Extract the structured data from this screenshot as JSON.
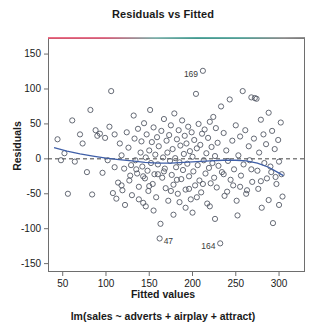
{
  "chart_data": {
    "type": "scatter",
    "title": "Residuals vs Fitted",
    "caption": "lm(sales ~ adverts + airplay + attract)",
    "xlabel": "Fitted values",
    "ylabel": "Residuals",
    "xlim": [
      33,
      330
    ],
    "ylim": [
      -162,
      173
    ],
    "xticks": [
      50,
      100,
      150,
      200,
      250,
      300
    ],
    "yticks": [
      150,
      100,
      50,
      0,
      -50,
      -100,
      -150
    ],
    "xtick_labels": [
      "50",
      "100",
      "150",
      "200",
      "250",
      "300"
    ],
    "ytick_labels": [
      "150",
      "100",
      "50",
      "0",
      "-50",
      "-100",
      "-150"
    ],
    "grid": false,
    "legend": null,
    "reference_line": {
      "y": 0,
      "style": "dashed",
      "color": "#444444"
    },
    "smoother": {
      "name": "loess",
      "color": "#3f5fa8",
      "points": [
        [
          40,
          16
        ],
        [
          55,
          11
        ],
        [
          70,
          7
        ],
        [
          85,
          4
        ],
        [
          100,
          1
        ],
        [
          115,
          -1
        ],
        [
          130,
          -3
        ],
        [
          145,
          -5
        ],
        [
          160,
          -6
        ],
        [
          175,
          -6
        ],
        [
          190,
          -5
        ],
        [
          205,
          -4
        ],
        [
          220,
          -3
        ],
        [
          235,
          -2
        ],
        [
          250,
          -2
        ],
        [
          262,
          -3
        ],
        [
          275,
          -6
        ],
        [
          288,
          -12
        ],
        [
          298,
          -19
        ],
        [
          305,
          -24
        ]
      ]
    },
    "point_style": {
      "marker": "open-circle",
      "color": "#555a66",
      "radius": 2.6
    },
    "labeled_points": [
      {
        "label": "169",
        "x": 212,
        "y": 126,
        "label_side": "left"
      },
      {
        "label": "47",
        "x": 162,
        "y": -114,
        "label_side": "right"
      },
      {
        "label": "164",
        "x": 232,
        "y": -121,
        "label_side": "left"
      }
    ],
    "points": [
      [
        44,
        28
      ],
      [
        48,
        -2
      ],
      [
        52,
        8
      ],
      [
        56,
        -50
      ],
      [
        61,
        55
      ],
      [
        64,
        -4
      ],
      [
        70,
        35
      ],
      [
        73,
        22
      ],
      [
        78,
        -19
      ],
      [
        82,
        70
      ],
      [
        84,
        -51
      ],
      [
        88,
        41
      ],
      [
        90,
        33
      ],
      [
        93,
        36
      ],
      [
        96,
        -20
      ],
      [
        99,
        30
      ],
      [
        102,
        -2
      ],
      [
        104,
        46
      ],
      [
        106,
        97
      ],
      [
        108,
        -49
      ],
      [
        110,
        35
      ],
      [
        112,
        -57
      ],
      [
        114,
        -34
      ],
      [
        116,
        22
      ],
      [
        118,
        5
      ],
      [
        119,
        -45
      ],
      [
        121,
        -14
      ],
      [
        122,
        -66
      ],
      [
        124,
        38
      ],
      [
        126,
        16
      ],
      [
        127,
        -31
      ],
      [
        129,
        -9
      ],
      [
        130,
        -52
      ],
      [
        132,
        62
      ],
      [
        133,
        29
      ],
      [
        134,
        -2
      ],
      [
        136,
        -21
      ],
      [
        137,
        43
      ],
      [
        138,
        -40
      ],
      [
        140,
        9
      ],
      [
        141,
        25
      ],
      [
        142,
        -11
      ],
      [
        143,
        -63
      ],
      [
        144,
        51
      ],
      [
        145,
        -28
      ],
      [
        146,
        2
      ],
      [
        147,
        35
      ],
      [
        148,
        -17
      ],
      [
        149,
        -46
      ],
      [
        150,
        12
      ],
      [
        151,
        70
      ],
      [
        152,
        -6
      ],
      [
        153,
        24
      ],
      [
        154,
        -36
      ],
      [
        155,
        45
      ],
      [
        156,
        -22
      ],
      [
        157,
        6
      ],
      [
        158,
        -55
      ],
      [
        159,
        31
      ],
      [
        160,
        -8
      ],
      [
        161,
        18
      ],
      [
        163,
        -93
      ],
      [
        164,
        40
      ],
      [
        165,
        -27
      ],
      [
        166,
        2
      ],
      [
        167,
        57
      ],
      [
        168,
        -14
      ],
      [
        169,
        -42
      ],
      [
        170,
        26
      ],
      [
        171,
        9
      ],
      [
        172,
        -60
      ],
      [
        173,
        34
      ],
      [
        174,
        -3
      ],
      [
        175,
        48
      ],
      [
        176,
        -23
      ],
      [
        177,
        14
      ],
      [
        178,
        -37
      ],
      [
        179,
        65
      ],
      [
        180,
        1
      ],
      [
        181,
        -12
      ],
      [
        182,
        28
      ],
      [
        183,
        -50
      ],
      [
        184,
        41
      ],
      [
        185,
        -5
      ],
      [
        186,
        19
      ],
      [
        187,
        -29
      ],
      [
        188,
        55
      ],
      [
        189,
        -16
      ],
      [
        190,
        7
      ],
      [
        191,
        33
      ],
      [
        192,
        -44
      ],
      [
        193,
        22
      ],
      [
        194,
        -7
      ],
      [
        195,
        46
      ],
      [
        196,
        -25
      ],
      [
        197,
        11
      ],
      [
        198,
        -58
      ],
      [
        199,
        38
      ],
      [
        200,
        3
      ],
      [
        201,
        -18
      ],
      [
        202,
        27
      ],
      [
        203,
        -38
      ],
      [
        204,
        93
      ],
      [
        205,
        15
      ],
      [
        206,
        -9
      ],
      [
        207,
        50
      ],
      [
        208,
        -31
      ],
      [
        209,
        20
      ],
      [
        210,
        -48
      ],
      [
        211,
        36
      ],
      [
        213,
        -2
      ],
      [
        214,
        42
      ],
      [
        215,
        -21
      ],
      [
        216,
        8
      ],
      [
        217,
        -64
      ],
      [
        218,
        30
      ],
      [
        219,
        -13
      ],
      [
        220,
        53
      ],
      [
        221,
        -35
      ],
      [
        222,
        17
      ],
      [
        223,
        -6
      ],
      [
        224,
        60
      ],
      [
        225,
        -27
      ],
      [
        226,
        4
      ],
      [
        227,
        44
      ],
      [
        228,
        -41
      ],
      [
        229,
        23
      ],
      [
        230,
        -10
      ],
      [
        233,
        75
      ],
      [
        234,
        -19
      ],
      [
        236,
        37
      ],
      [
        237,
        -53
      ],
      [
        239,
        12
      ],
      [
        241,
        -3
      ],
      [
        243,
        85
      ],
      [
        244,
        -30
      ],
      [
        246,
        26
      ],
      [
        248,
        -15
      ],
      [
        250,
        48
      ],
      [
        251,
        -60
      ],
      [
        253,
        5
      ],
      [
        255,
        32
      ],
      [
        256,
        -24
      ],
      [
        258,
        97
      ],
      [
        259,
        -8
      ],
      [
        261,
        41
      ],
      [
        263,
        -45
      ],
      [
        265,
        18
      ],
      [
        266,
        -2
      ],
      [
        268,
        88
      ],
      [
        269,
        -33
      ],
      [
        271,
        29
      ],
      [
        272,
        87
      ],
      [
        274,
        86
      ],
      [
        275,
        -17
      ],
      [
        277,
        9
      ],
      [
        279,
        56
      ],
      [
        280,
        -70
      ],
      [
        282,
        35
      ],
      [
        283,
        -6
      ],
      [
        285,
        21
      ],
      [
        286,
        -28
      ],
      [
        288,
        66
      ],
      [
        290,
        -11
      ],
      [
        292,
        40
      ],
      [
        293,
        -92
      ],
      [
        295,
        14
      ],
      [
        297,
        -36
      ],
      [
        299,
        27
      ],
      [
        300,
        -4
      ],
      [
        302,
        52
      ],
      [
        303,
        -22
      ],
      [
        304,
        -54
      ],
      [
        160,
        -22
      ],
      [
        167,
        -18
      ],
      [
        175,
        -46
      ],
      [
        185,
        -62
      ],
      [
        192,
        -70
      ],
      [
        150,
        -39
      ],
      [
        143,
        -25
      ],
      [
        205,
        -55
      ],
      [
        212,
        -36
      ],
      [
        220,
        -68
      ],
      [
        128,
        -24
      ],
      [
        135,
        -15
      ],
      [
        240,
        -47
      ],
      [
        247,
        -38
      ],
      [
        262,
        -50
      ],
      [
        276,
        -43
      ],
      [
        288,
        -59
      ],
      [
        296,
        -26
      ],
      [
        118,
        -38
      ],
      [
        110,
        -12
      ],
      [
        155,
        -74
      ],
      [
        178,
        -80
      ],
      [
        200,
        -77
      ],
      [
        226,
        -86
      ],
      [
        252,
        -81
      ],
      [
        138,
        -58
      ],
      [
        146,
        -68
      ],
      [
        182,
        -30
      ],
      [
        196,
        -43
      ],
      [
        236,
        -22
      ],
      [
        255,
        -40
      ],
      [
        268,
        -15
      ],
      [
        279,
        -32
      ],
      [
        291,
        -19
      ],
      [
        300,
        -66
      ]
    ]
  }
}
